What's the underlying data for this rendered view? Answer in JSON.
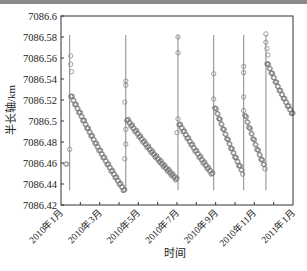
{
  "chart_data": {
    "type": "scatter",
    "title": "",
    "xlabel": "时间",
    "ylabel": "半长轴/km",
    "ylim": [
      7086.42,
      7086.6
    ],
    "yticks": [
      "7086.42",
      "7086.44",
      "7086.46",
      "7086.48",
      "7086.5",
      "7086.52",
      "7086.54",
      "7086.56",
      "7086.58",
      "7086.6"
    ],
    "xticks": [
      "2010年1月",
      "2010年3月",
      "2010年5月",
      "2010年7月",
      "2010年9月",
      "2010年11月",
      "2011年1月"
    ],
    "xlim_months": [
      0,
      12
    ],
    "grid": false,
    "legend": null,
    "marker": "open circle",
    "maneuver_lines_month": [
      0.45,
      3.35,
      6.05,
      7.9,
      9.45,
      10.6
    ],
    "segments": [
      {
        "start_month": 0.5,
        "end_month": 3.3,
        "start_value": 7086.525,
        "end_value": 7086.433
      },
      {
        "start_month": 3.4,
        "end_month": 6.0,
        "start_value": 7086.502,
        "end_value": 7086.444
      },
      {
        "start_month": 6.1,
        "end_month": 7.85,
        "start_value": 7086.498,
        "end_value": 7086.449
      },
      {
        "start_month": 7.95,
        "end_month": 9.4,
        "start_value": 7086.514,
        "end_value": 7086.451
      },
      {
        "start_month": 9.5,
        "end_month": 10.55,
        "start_value": 7086.507,
        "end_value": 7086.456
      },
      {
        "start_month": 10.65,
        "end_month": 12.0,
        "start_value": 7086.556,
        "end_value": 7086.506
      }
    ],
    "outliers": [
      {
        "month": 0.25,
        "value": 7086.459
      },
      {
        "month": 0.3,
        "value": 7086.459
      },
      {
        "month": 0.45,
        "value": 7086.473
      },
      {
        "month": 0.5,
        "value": 7086.562
      },
      {
        "month": 0.5,
        "value": 7086.554
      },
      {
        "month": 0.55,
        "value": 7086.547
      },
      {
        "month": 3.3,
        "value": 7086.464
      },
      {
        "month": 3.35,
        "value": 7086.538
      },
      {
        "month": 3.35,
        "value": 7086.534
      },
      {
        "month": 3.3,
        "value": 7086.518
      },
      {
        "month": 3.35,
        "value": 7086.492
      },
      {
        "month": 3.35,
        "value": 7086.478
      },
      {
        "month": 6.05,
        "value": 7086.58
      },
      {
        "month": 6.05,
        "value": 7086.565
      },
      {
        "month": 6.05,
        "value": 7086.502
      },
      {
        "month": 6.0,
        "value": 7086.489
      },
      {
        "month": 7.9,
        "value": 7086.545
      },
      {
        "month": 7.9,
        "value": 7086.521
      },
      {
        "month": 9.45,
        "value": 7086.552
      },
      {
        "month": 9.45,
        "value": 7086.546
      },
      {
        "month": 9.45,
        "value": 7086.523
      },
      {
        "month": 9.45,
        "value": 7086.51
      },
      {
        "month": 10.6,
        "value": 7086.583
      },
      {
        "month": 10.6,
        "value": 7086.575
      },
      {
        "month": 10.65,
        "value": 7086.569
      },
      {
        "month": 10.7,
        "value": 7086.563
      }
    ]
  }
}
